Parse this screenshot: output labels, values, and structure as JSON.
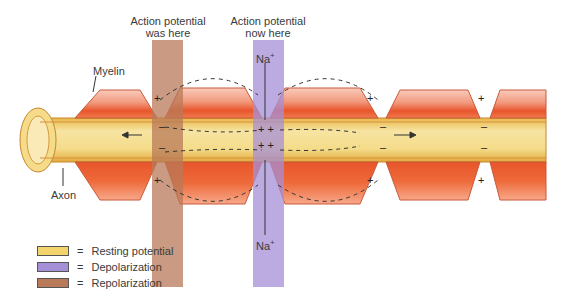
{
  "diagram": {
    "labels": {
      "was_here": [
        "Action potential",
        "was here"
      ],
      "now_here": [
        "Action potential",
        "now here"
      ],
      "myelin": "Myelin",
      "axon": "Axon",
      "na_top": "Na",
      "na_bottom": "Na",
      "na_charge": "+"
    },
    "colors": {
      "resting": "#f3d36b",
      "depolarization": "#a58fd6",
      "repolarization": "#b87a58",
      "myelin_light": "#f7c3b2",
      "myelin_dark": "#e8532a",
      "axon_core": "#f5dc8a"
    },
    "legend": [
      {
        "label": "Resting potential",
        "color": "#f3d36b"
      },
      {
        "label": "Depolarization",
        "color": "#a58fd6"
      },
      {
        "label": "Repolarization",
        "color": "#b87a58"
      }
    ],
    "equals": "="
  }
}
